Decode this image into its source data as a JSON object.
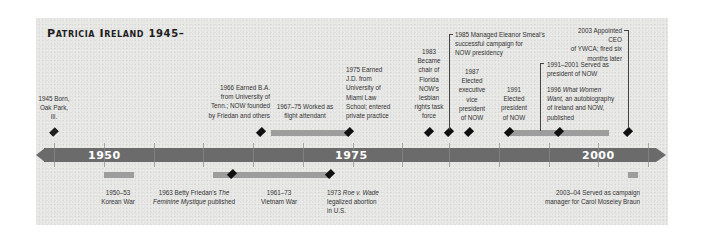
{
  "title": {
    "name": "Patricia Ireland",
    "years": "1945–"
  },
  "axis": {
    "labels": [
      {
        "year": 1950,
        "text": "1950"
      },
      {
        "year": 1975,
        "text": "1975"
      },
      {
        "year": 2000,
        "text": "2000"
      }
    ],
    "ticks": [
      1945,
      1950,
      1955,
      1960,
      1965,
      1970,
      1975,
      1980,
      1985,
      1990,
      1995,
      2000,
      2005
    ],
    "color": "#6b6b6b"
  },
  "events_above": [
    {
      "id": "born",
      "year": "1945",
      "text": "1945 Born, Oak Park, Ill."
    },
    {
      "id": "ba",
      "year": "1966",
      "text": "1966 Earned B.A. from University of Tenn.; NOW founded by Friedan and others"
    },
    {
      "id": "flight",
      "year": "1967–75",
      "text": "1967–75 Worked as flight attendant"
    },
    {
      "id": "jd",
      "year": "1975",
      "text": "1975 Earned J.D. from University of Miami Law School; entered private practice"
    },
    {
      "id": "florida",
      "year": "1983",
      "text": "1983 Became chair of Florida NOW's lesbian rights task force"
    },
    {
      "id": "smeal",
      "year": "1985",
      "text": "1985 Managed Eleanor Smeal's successful campaign for NOW presidency"
    },
    {
      "id": "evp",
      "year": "1987",
      "text": "1987 Elected executive vice president of NOW"
    },
    {
      "id": "president",
      "year": "1991",
      "text": "1991 Elected president of NOW"
    },
    {
      "id": "served",
      "year": "1991–2001",
      "text": "1991–2001 Served as president of NOW"
    },
    {
      "id": "book",
      "year": "1996",
      "text_prefix": "1996 ",
      "text_italic": "What Women Want,",
      "text_suffix": " an autobiography of Ireland and NOW, published"
    },
    {
      "id": "ywca",
      "year": "2003",
      "text": "2003 Appointed CEO of YWCA; fired six months later"
    }
  ],
  "events_below": [
    {
      "id": "korea",
      "year": "1950–53",
      "text": "1950–53 Korean War"
    },
    {
      "id": "friedan",
      "year": "1963",
      "text_prefix": "1963 Betty Friedan's ",
      "text_italic": "The Feminine Mystique",
      "text_suffix": " published"
    },
    {
      "id": "vietnam",
      "year": "1961–73",
      "text": "1961–73 Vietnam War"
    },
    {
      "id": "roe",
      "year": "1973",
      "text_prefix": "1973 ",
      "text_italic": "Roe v. Wade",
      "text_suffix": " legalized abortion in U.S."
    },
    {
      "id": "braun",
      "year": "2003–04",
      "text": "2003–04 Served as campaign manager for Carol Moseley Braun"
    }
  ],
  "labels_split": {
    "born": [
      "1945 Born,",
      "Oak Park,",
      "Ill."
    ],
    "ba": [
      "1966 Earned B.A.",
      "from University of",
      "Tenn.; NOW founded",
      "by Friedan and others"
    ],
    "flight": [
      "1967–75 Worked as",
      "flight attendant"
    ],
    "jd": [
      "1975 Earned",
      "J.D. from",
      "University of",
      "Miami Law",
      "School; entered",
      "private practice"
    ],
    "florida": [
      "1983",
      "Became",
      "chair of",
      "Florida",
      "NOW's",
      "lesbian",
      "rights task",
      "force"
    ],
    "smeal": [
      "1985 Managed Eleanor Smeal's",
      "successful campaign for",
      "NOW presidency"
    ],
    "evp": [
      "1987",
      "Elected",
      "executive",
      "vice",
      "president",
      "of NOW"
    ],
    "president": [
      "1991",
      "Elected",
      "president",
      "of NOW"
    ],
    "served": [
      "1991–2001 Served as",
      "president of NOW"
    ],
    "book_l1_prefix": "1996 ",
    "book_l1_italic": "What Women",
    "book_l2_italic": "Want,",
    "book_l2_suffix": " an autobiography",
    "book_l3": "of Ireland and NOW,",
    "book_l4": "published",
    "ywca": [
      "2003 Appointed CEO",
      "of YWCA; fired six",
      "months later"
    ],
    "korea": [
      "1950–53",
      "Korean War"
    ],
    "friedan_l1_prefix": "1963 Betty Friedan's ",
    "friedan_l1_italic": "The",
    "friedan_l2_italic": "Feminine Mystique",
    "friedan_l2_suffix": " published",
    "vietnam": [
      "1961–73",
      "Vietnam War"
    ],
    "roe_l1_prefix": "1973 ",
    "roe_l1_italic": "Roe v. Wade",
    "roe_l2": "legalized abortion",
    "roe_l3": "in U.S.",
    "braun": [
      "2003–04 Served as campaign",
      "manager for Carol Moseley Braun"
    ]
  }
}
